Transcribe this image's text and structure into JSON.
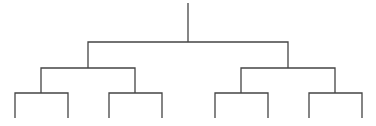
{
  "diagram": {
    "type": "tree",
    "line_color": "#444444",
    "background": "#ffffff",
    "levels": 4,
    "nodes": [
      {
        "id": "root",
        "x": 188,
        "y": 42
      },
      {
        "id": "L",
        "x": 88,
        "y": 68,
        "parent": "root"
      },
      {
        "id": "R",
        "x": 288,
        "y": 68,
        "parent": "root"
      },
      {
        "id": "LL",
        "x": 41,
        "y": 93,
        "parent": "L"
      },
      {
        "id": "LR",
        "x": 135,
        "y": 93,
        "parent": "L"
      },
      {
        "id": "RL",
        "x": 241,
        "y": 93,
        "parent": "R"
      },
      {
        "id": "RR",
        "x": 335,
        "y": 93,
        "parent": "R"
      }
    ],
    "leaves": [
      {
        "id": "leaf-1",
        "x": 15,
        "parent": "LL"
      },
      {
        "id": "leaf-2",
        "x": 68,
        "parent": "LL"
      },
      {
        "id": "leaf-3",
        "x": 109,
        "parent": "LR"
      },
      {
        "id": "leaf-4",
        "x": 162,
        "parent": "LR"
      },
      {
        "id": "leaf-5",
        "x": 215,
        "parent": "RL"
      },
      {
        "id": "leaf-6",
        "x": 268,
        "parent": "RL"
      },
      {
        "id": "leaf-7",
        "x": 309,
        "parent": "RR"
      },
      {
        "id": "leaf-8",
        "x": 362,
        "parent": "RR"
      }
    ]
  }
}
